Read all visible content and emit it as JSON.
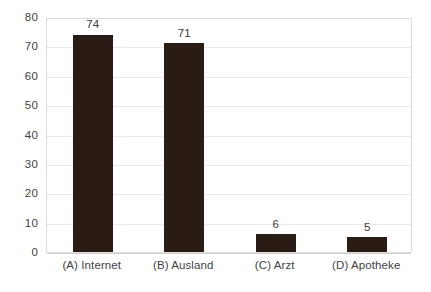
{
  "chart_data": {
    "type": "bar",
    "title": "",
    "subtitle": "",
    "xlabel": "",
    "ylabel": "",
    "categories": [
      "(A) Internet",
      "(B) Ausland",
      "(C) Arzt",
      "(D) Apotheke"
    ],
    "values": [
      74,
      71,
      6,
      5
    ],
    "value_labels": [
      "74",
      "71",
      "6",
      "5"
    ],
    "ylim": [
      0,
      80
    ],
    "ytick_values": [
      0,
      10,
      20,
      30,
      40,
      50,
      60,
      70,
      80
    ],
    "ytick_labels": [
      "0",
      "10",
      "20",
      "30",
      "40",
      "50",
      "60",
      "70",
      "80"
    ],
    "grid": "horizontal",
    "legend": "none",
    "colors": {
      "bar": "#2a1c15",
      "gridline": "#e9e9e9",
      "plot_border": "#dcdcdc",
      "tick_text": "#3f3f3f",
      "value_text": "#3a3a3a",
      "background": "#ffffff"
    }
  }
}
